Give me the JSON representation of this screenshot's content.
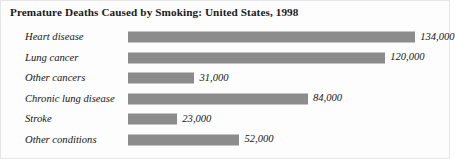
{
  "chart_data": {
    "type": "bar",
    "orientation": "horizontal",
    "title": "Premature Deaths Caused by Smoking: United States, 1998",
    "xlabel": "",
    "ylabel": "",
    "grid": false,
    "legend": "none",
    "xlim": [
      0,
      140000
    ],
    "categories": [
      "Heart disease",
      "Lung cancer",
      "Other cancers",
      "Chronic lung disease",
      "Stroke",
      "Other conditions"
    ],
    "values": [
      134000,
      120000,
      31000,
      84000,
      23000,
      52000
    ],
    "value_labels": [
      "134,000",
      "120,000",
      "31,000",
      "84,000",
      "23,000",
      "52,000"
    ],
    "bars": [
      {
        "category": "Heart disease",
        "value": 134000,
        "label": "134,000"
      },
      {
        "category": "Lung cancer",
        "value": 120000,
        "label": "120,000"
      },
      {
        "category": "Other cancers",
        "value": 31000,
        "label": "31,000"
      },
      {
        "category": "Chronic lung disease",
        "value": 84000,
        "label": "84,000"
      },
      {
        "category": "Stroke",
        "value": 23000,
        "label": "23,000"
      },
      {
        "category": "Other conditions",
        "value": 52000,
        "label": "52,000"
      }
    ],
    "colors": {
      "bar": "#8c8c8c",
      "text": "#151515",
      "title": "#1a1a1a",
      "background": "#fdfdfd",
      "border": "#e6e6e6"
    }
  }
}
